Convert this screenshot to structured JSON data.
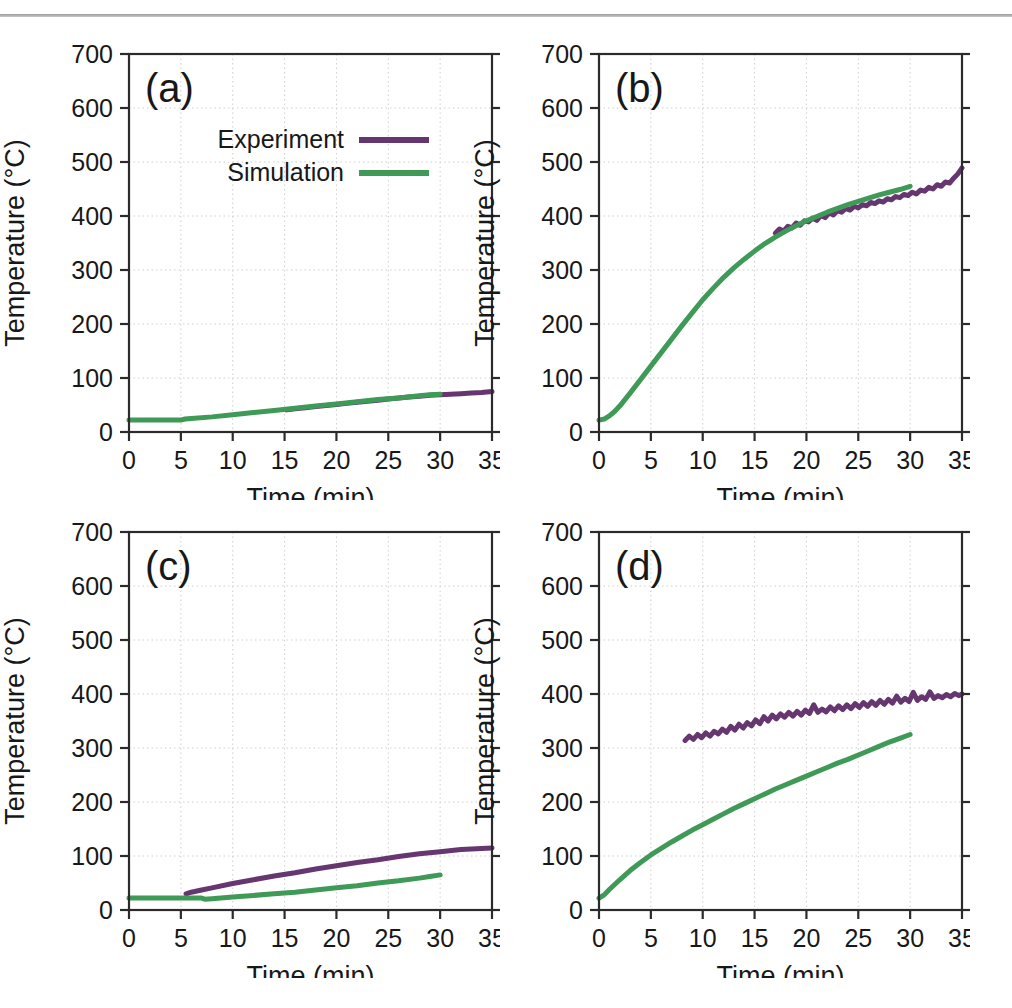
{
  "page": {
    "running_head": "",
    "rule_color": "#9a9a9a"
  },
  "figure": {
    "axis_x_title": "Time (min)",
    "axis_y_title": "Temperature (°C)",
    "x_ticks": [
      "0",
      "5",
      "10",
      "15",
      "20",
      "25",
      "30",
      "35"
    ],
    "y_ticks": [
      "0",
      "100",
      "200",
      "300",
      "400",
      "500",
      "600",
      "700"
    ],
    "legend": {
      "experiment_label": "Experiment",
      "simulation_label": "Simulation",
      "experiment_color": "#65366f",
      "simulation_color": "#3f9a57"
    },
    "panels": [
      {
        "tag": "(a)"
      },
      {
        "tag": "(b)"
      },
      {
        "tag": "(c)"
      },
      {
        "tag": "(d)"
      }
    ]
  },
  "chart_data": [
    {
      "type": "line",
      "panel": "(a)",
      "title": "(a)",
      "xlabel": "Time (min)",
      "ylabel": "Temperature (°C)",
      "xlim": [
        0,
        35
      ],
      "ylim": [
        0,
        700
      ],
      "xticks": [
        0,
        5,
        10,
        15,
        20,
        25,
        30,
        35
      ],
      "yticks": [
        0,
        100,
        200,
        300,
        400,
        500,
        600,
        700
      ],
      "grid": true,
      "legend": "inside-top",
      "series": [
        {
          "name": "Experiment",
          "color": "#65366f",
          "x": [
            15.2,
            16,
            17,
            18,
            19,
            20,
            21,
            22,
            23,
            24,
            25,
            26,
            27,
            28,
            29,
            30,
            31,
            32,
            33,
            34,
            35
          ],
          "y": [
            41,
            43,
            45,
            47,
            49,
            51,
            53,
            55,
            57,
            59,
            61,
            63,
            65,
            66,
            68,
            69,
            70,
            71,
            72,
            73,
            75
          ]
        },
        {
          "name": "Simulation",
          "color": "#3f9a57",
          "x": [
            0,
            2,
            4,
            5,
            5.4,
            6,
            8,
            10,
            12,
            14,
            16,
            18,
            20,
            22,
            24,
            26,
            28,
            29,
            30
          ],
          "y": [
            22,
            22,
            22,
            22,
            24,
            25,
            28,
            32,
            36,
            40,
            44,
            48,
            52,
            56,
            60,
            63,
            67,
            69,
            70
          ]
        }
      ]
    },
    {
      "type": "line",
      "panel": "(b)",
      "title": "(b)",
      "xlabel": "Time (min)",
      "ylabel": "Temperature (°C)",
      "xlim": [
        0,
        35
      ],
      "ylim": [
        0,
        700
      ],
      "xticks": [
        0,
        5,
        10,
        15,
        20,
        25,
        30,
        35
      ],
      "yticks": [
        0,
        100,
        200,
        300,
        400,
        500,
        600,
        700
      ],
      "grid": true,
      "legend": "none",
      "series": [
        {
          "name": "Experiment",
          "color": "#65366f",
          "x": [
            17.0,
            17.4,
            17.8,
            18.2,
            18.6,
            19.0,
            19.4,
            19.8,
            20.2,
            20.6,
            21.0,
            21.4,
            21.8,
            22.2,
            22.6,
            23.0,
            23.4,
            23.8,
            24.2,
            24.6,
            25.0,
            25.4,
            25.8,
            26.2,
            26.6,
            27.0,
            27.4,
            27.8,
            28.2,
            28.6,
            29.0,
            29.4,
            29.8,
            30.2,
            30.6,
            31.0,
            31.4,
            31.8,
            32.2,
            32.6,
            33.0,
            33.4,
            33.8,
            34.2,
            34.6,
            35.0
          ],
          "y": [
            368,
            376,
            372,
            381,
            378,
            387,
            383,
            391,
            389,
            396,
            392,
            401,
            397,
            406,
            402,
            410,
            407,
            414,
            411,
            418,
            415,
            421,
            419,
            425,
            423,
            428,
            426,
            432,
            430,
            436,
            434,
            440,
            438,
            444,
            441,
            448,
            446,
            453,
            450,
            458,
            455,
            463,
            461,
            470,
            478,
            489
          ]
        },
        {
          "name": "Simulation",
          "color": "#3f9a57",
          "x": [
            0,
            0.5,
            1,
            1.5,
            2,
            3,
            4,
            5,
            6,
            7,
            8,
            9,
            10,
            11,
            12,
            13,
            14,
            15,
            16,
            17,
            18,
            19,
            20,
            21,
            22,
            23,
            24,
            25,
            26,
            27,
            28,
            29,
            30
          ],
          "y": [
            22,
            24,
            30,
            38,
            48,
            72,
            97,
            122,
            147,
            172,
            197,
            221,
            245,
            266,
            286,
            304,
            320,
            335,
            349,
            361,
            372,
            382,
            391,
            399,
            407,
            414,
            421,
            427,
            433,
            439,
            444,
            449,
            455
          ]
        }
      ]
    },
    {
      "type": "line",
      "panel": "(c)",
      "title": "(c)",
      "xlabel": "Time (min)",
      "ylabel": "Temperature (°C)",
      "xlim": [
        0,
        35
      ],
      "ylim": [
        0,
        700
      ],
      "xticks": [
        0,
        5,
        10,
        15,
        20,
        25,
        30,
        35
      ],
      "yticks": [
        0,
        100,
        200,
        300,
        400,
        500,
        600,
        700
      ],
      "grid": true,
      "legend": "none",
      "series": [
        {
          "name": "Experiment",
          "color": "#65366f",
          "x": [
            5.5,
            6,
            7,
            8,
            10,
            12,
            14,
            16,
            18,
            20,
            22,
            24,
            26,
            28,
            30,
            32,
            34,
            35
          ],
          "y": [
            30,
            33,
            37,
            41,
            49,
            56,
            63,
            69,
            76,
            82,
            88,
            93,
            99,
            104,
            108,
            112,
            114,
            115
          ]
        },
        {
          "name": "Simulation",
          "color": "#3f9a57",
          "x": [
            0,
            2,
            4,
            6,
            7,
            7.3,
            8,
            10,
            12,
            14,
            16,
            18,
            20,
            22,
            24,
            26,
            28,
            29,
            30
          ],
          "y": [
            22,
            22,
            22,
            22,
            22,
            20,
            21,
            24,
            27,
            30,
            33,
            37,
            41,
            45,
            50,
            54,
            59,
            62,
            65
          ]
        }
      ]
    },
    {
      "type": "line",
      "panel": "(d)",
      "title": "(d)",
      "xlabel": "Time (min)",
      "ylabel": "Temperature (°C)",
      "xlim": [
        0,
        35
      ],
      "ylim": [
        0,
        700
      ],
      "xticks": [
        0,
        5,
        10,
        15,
        20,
        25,
        30,
        35
      ],
      "yticks": [
        0,
        100,
        200,
        300,
        400,
        500,
        600,
        700
      ],
      "grid": true,
      "legend": "none",
      "series": [
        {
          "name": "Experiment",
          "color": "#65366f",
          "x": [
            8.3,
            8.7,
            9.1,
            9.5,
            9.9,
            10.3,
            10.7,
            11.1,
            11.5,
            11.9,
            12.3,
            12.7,
            13.1,
            13.5,
            13.9,
            14.3,
            14.7,
            15.1,
            15.5,
            15.9,
            16.3,
            16.7,
            17.1,
            17.5,
            17.9,
            18.3,
            18.7,
            19.1,
            19.5,
            19.9,
            20.3,
            20.7,
            21.1,
            21.5,
            21.9,
            22.3,
            22.7,
            23.1,
            23.5,
            23.9,
            24.3,
            24.7,
            25.1,
            25.5,
            25.9,
            26.3,
            26.7,
            27.1,
            27.5,
            27.9,
            28.3,
            28.7,
            29.1,
            29.5,
            29.9,
            30.3,
            30.7,
            31.1,
            31.5,
            31.9,
            32.3,
            32.7,
            33.1,
            33.5,
            33.9,
            34.3,
            34.7,
            35.0
          ],
          "y": [
            314,
            322,
            316,
            325,
            319,
            328,
            322,
            331,
            326,
            335,
            329,
            340,
            333,
            344,
            337,
            347,
            341,
            352,
            345,
            358,
            350,
            361,
            354,
            363,
            357,
            366,
            359,
            368,
            361,
            370,
            364,
            380,
            366,
            372,
            367,
            376,
            369,
            378,
            371,
            380,
            373,
            382,
            375,
            384,
            377,
            386,
            379,
            388,
            381,
            390,
            383,
            396,
            385,
            392,
            386,
            403,
            388,
            395,
            390,
            404,
            392,
            397,
            393,
            399,
            395,
            401,
            397,
            400
          ]
        },
        {
          "name": "Simulation",
          "color": "#3f9a57",
          "x": [
            0,
            0.5,
            1,
            2,
            3,
            4,
            5,
            6,
            7,
            8,
            9,
            10,
            11,
            12,
            13,
            14,
            15,
            16,
            17,
            18,
            19,
            20,
            21,
            22,
            23,
            24,
            25,
            26,
            27,
            28,
            29,
            30
          ],
          "y": [
            22,
            28,
            38,
            56,
            73,
            88,
            102,
            114,
            126,
            137,
            148,
            158,
            168,
            178,
            188,
            197,
            206,
            215,
            224,
            232,
            240,
            248,
            256,
            264,
            272,
            279,
            287,
            295,
            303,
            311,
            318,
            325
          ]
        }
      ]
    }
  ]
}
